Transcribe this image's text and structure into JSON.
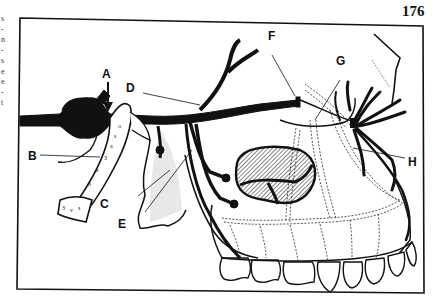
{
  "page": {
    "figure_number": "176",
    "margin_text_fragments": [
      "s",
      "-",
      "n",
      "-",
      "s",
      "e",
      "e",
      "-",
      "t"
    ]
  },
  "diagram": {
    "labels": [
      {
        "id": "A",
        "text": "A"
      },
      {
        "id": "B",
        "text": "B"
      },
      {
        "id": "C",
        "text": "C"
      },
      {
        "id": "D",
        "text": "D"
      },
      {
        "id": "E",
        "text": "E"
      },
      {
        "id": "F",
        "text": "F"
      },
      {
        "id": "G",
        "text": "G"
      },
      {
        "id": "H",
        "text": "H"
      }
    ],
    "colors": {
      "ink": "#111111",
      "background": "#ffffff",
      "shading": "#bdbdbd"
    }
  }
}
